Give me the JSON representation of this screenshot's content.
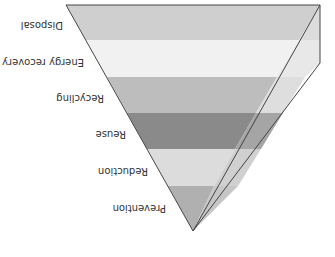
{
  "diagram": {
    "orientation": "rotated-180",
    "levels": [
      {
        "label": "Disposal",
        "front": "#cfcfcf",
        "side": "#dcdcdc"
      },
      {
        "label": "Energy recovery",
        "front": "#f1f1f1",
        "side": "#e6e6e6"
      },
      {
        "label": "Recycling",
        "front": "#bdbdbd",
        "side": "#e2e2e2"
      },
      {
        "label": "Reuse",
        "front": "#8a8a8a",
        "side": "#a9a9a9"
      },
      {
        "label": "Reduction",
        "front": "#dcdcdc",
        "side": "#cfcfcf"
      },
      {
        "label": "Prevention",
        "front": "#b0b0b0",
        "side": "#c9c9c9"
      }
    ],
    "edge_color": "#444444"
  }
}
